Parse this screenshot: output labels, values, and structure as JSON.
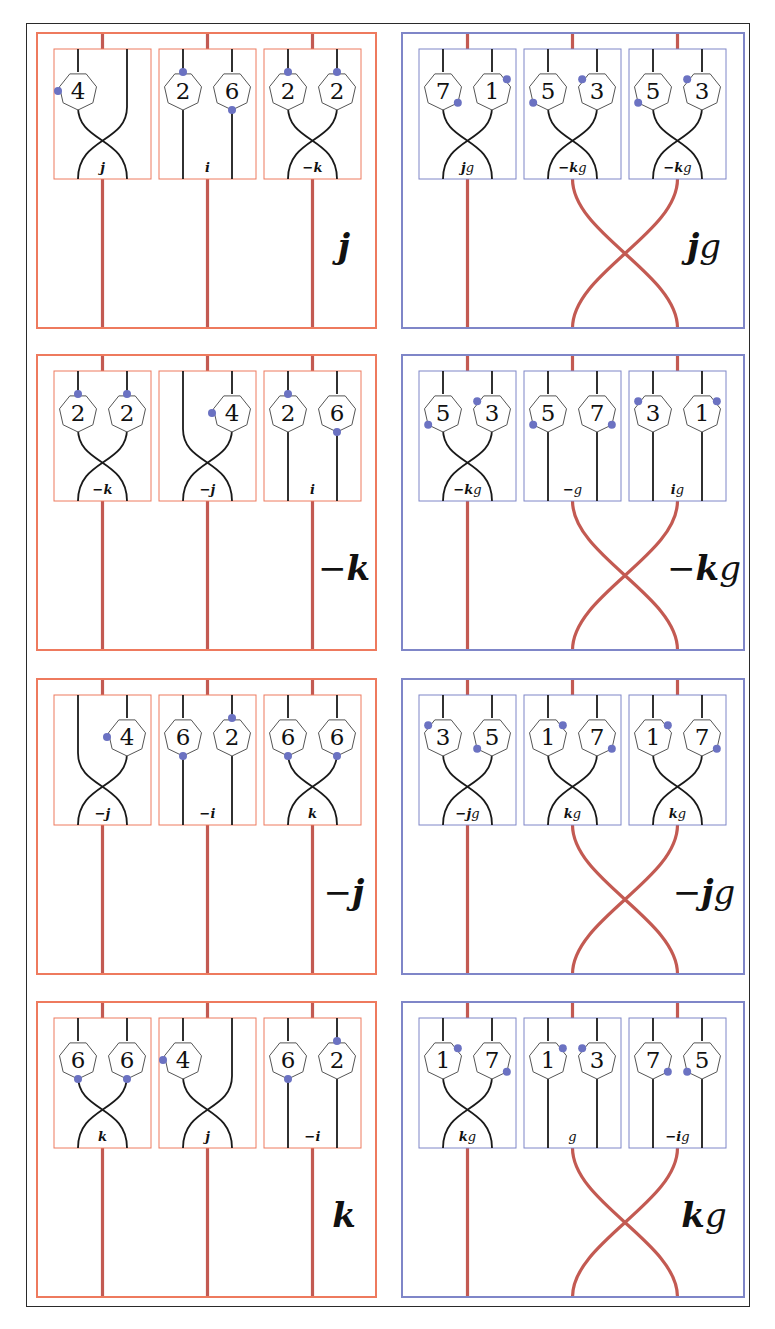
{
  "figure": {
    "colors": {
      "frame": "#2a2a2a",
      "orange_border": "#ee7a5e",
      "blue_border": "#7f86c8",
      "red_strand": "#c35a52",
      "black_strand": "#1a1a1a",
      "dot": "#6b72c2",
      "heptagon_stroke": "#555555"
    },
    "rows": [
      {
        "left": {
          "color": "orange",
          "label": "j",
          "label_suffix": "",
          "label_sign": "",
          "bottom_twist": false,
          "boxes": [
            {
              "sign_label": "j",
              "suffix": "",
              "strands": "cross",
              "gons": [
                {
                  "pos": "L",
                  "n": "4",
                  "dot": "left"
                }
              ]
            },
            {
              "sign_label": "i",
              "suffix": "",
              "strands": "straight",
              "gons": [
                {
                  "pos": "L",
                  "n": "2",
                  "dot": "top"
                },
                {
                  "pos": "R",
                  "n": "6",
                  "dot": "bottom"
                }
              ]
            },
            {
              "sign_label": "−k",
              "suffix": "",
              "strands": "cross",
              "gons": [
                {
                  "pos": "L",
                  "n": "2",
                  "dot": "top"
                },
                {
                  "pos": "R",
                  "n": "2",
                  "dot": "top"
                }
              ]
            }
          ]
        },
        "right": {
          "color": "blue",
          "label": "j",
          "label_suffix": "g",
          "label_sign": "",
          "bottom_twist": true,
          "boxes": [
            {
              "sign_label": "j",
              "suffix": "g",
              "strands": "cross",
              "gons": [
                {
                  "pos": "L",
                  "n": "7",
                  "dot": "bottom-right"
                },
                {
                  "pos": "R",
                  "n": "1",
                  "dot": "top-right"
                }
              ]
            },
            {
              "sign_label": "−k",
              "suffix": "g",
              "strands": "cross",
              "gons": [
                {
                  "pos": "L",
                  "n": "5",
                  "dot": "bottom-left"
                },
                {
                  "pos": "R",
                  "n": "3",
                  "dot": "top-left"
                }
              ]
            },
            {
              "sign_label": "−k",
              "suffix": "g",
              "strands": "cross",
              "gons": [
                {
                  "pos": "L",
                  "n": "5",
                  "dot": "bottom-left"
                },
                {
                  "pos": "R",
                  "n": "3",
                  "dot": "top-left"
                }
              ]
            }
          ]
        }
      },
      {
        "left": {
          "color": "orange",
          "label": "k",
          "label_suffix": "",
          "label_sign": "−",
          "bottom_twist": false,
          "boxes": [
            {
              "sign_label": "−k",
              "suffix": "",
              "strands": "cross",
              "gons": [
                {
                  "pos": "L",
                  "n": "2",
                  "dot": "top"
                },
                {
                  "pos": "R",
                  "n": "2",
                  "dot": "top"
                }
              ]
            },
            {
              "sign_label": "−j",
              "suffix": "",
              "strands": "cross",
              "gons": [
                {
                  "pos": "R",
                  "n": "4",
                  "dot": "left"
                }
              ]
            },
            {
              "sign_label": "i",
              "suffix": "",
              "strands": "straight",
              "gons": [
                {
                  "pos": "L",
                  "n": "2",
                  "dot": "top"
                },
                {
                  "pos": "R",
                  "n": "6",
                  "dot": "bottom"
                }
              ]
            }
          ]
        },
        "right": {
          "color": "blue",
          "label": "k",
          "label_suffix": "g",
          "label_sign": "−",
          "bottom_twist": true,
          "boxes": [
            {
              "sign_label": "−k",
              "suffix": "g",
              "strands": "cross",
              "gons": [
                {
                  "pos": "L",
                  "n": "5",
                  "dot": "bottom-left"
                },
                {
                  "pos": "R",
                  "n": "3",
                  "dot": "top-left"
                }
              ]
            },
            {
              "sign_label": "−",
              "suffix": "g",
              "strands": "straight",
              "gons": [
                {
                  "pos": "L",
                  "n": "5",
                  "dot": "bottom-left"
                },
                {
                  "pos": "R",
                  "n": "7",
                  "dot": "bottom-right"
                }
              ]
            },
            {
              "sign_label": "i",
              "suffix": "g",
              "strands": "straight",
              "gons": [
                {
                  "pos": "L",
                  "n": "3",
                  "dot": "top-left"
                },
                {
                  "pos": "R",
                  "n": "1",
                  "dot": "top-right"
                }
              ]
            }
          ]
        }
      },
      {
        "left": {
          "color": "orange",
          "label": "j",
          "label_suffix": "",
          "label_sign": "−",
          "bottom_twist": false,
          "boxes": [
            {
              "sign_label": "−j",
              "suffix": "",
              "strands": "cross",
              "gons": [
                {
                  "pos": "R",
                  "n": "4",
                  "dot": "left"
                }
              ]
            },
            {
              "sign_label": "−i",
              "suffix": "",
              "strands": "straight",
              "gons": [
                {
                  "pos": "L",
                  "n": "6",
                  "dot": "bottom"
                },
                {
                  "pos": "R",
                  "n": "2",
                  "dot": "top"
                }
              ]
            },
            {
              "sign_label": "k",
              "suffix": "",
              "strands": "cross",
              "gons": [
                {
                  "pos": "L",
                  "n": "6",
                  "dot": "bottom"
                },
                {
                  "pos": "R",
                  "n": "6",
                  "dot": "bottom"
                }
              ]
            }
          ]
        },
        "right": {
          "color": "blue",
          "label": "j",
          "label_suffix": "g",
          "label_sign": "−",
          "bottom_twist": true,
          "boxes": [
            {
              "sign_label": "−j",
              "suffix": "g",
              "strands": "cross",
              "gons": [
                {
                  "pos": "L",
                  "n": "3",
                  "dot": "top-left"
                },
                {
                  "pos": "R",
                  "n": "5",
                  "dot": "bottom-left"
                }
              ]
            },
            {
              "sign_label": "k",
              "suffix": "g",
              "strands": "cross",
              "gons": [
                {
                  "pos": "L",
                  "n": "1",
                  "dot": "top-right"
                },
                {
                  "pos": "R",
                  "n": "7",
                  "dot": "bottom-right"
                }
              ]
            },
            {
              "sign_label": "k",
              "suffix": "g",
              "strands": "cross",
              "gons": [
                {
                  "pos": "L",
                  "n": "1",
                  "dot": "top-right"
                },
                {
                  "pos": "R",
                  "n": "7",
                  "dot": "bottom-right"
                }
              ]
            }
          ]
        }
      },
      {
        "left": {
          "color": "orange",
          "label": "k",
          "label_suffix": "",
          "label_sign": "",
          "bottom_twist": false,
          "boxes": [
            {
              "sign_label": "k",
              "suffix": "",
              "strands": "cross",
              "gons": [
                {
                  "pos": "L",
                  "n": "6",
                  "dot": "bottom"
                },
                {
                  "pos": "R",
                  "n": "6",
                  "dot": "bottom"
                }
              ]
            },
            {
              "sign_label": "j",
              "suffix": "",
              "strands": "cross",
              "gons": [
                {
                  "pos": "L",
                  "n": "4",
                  "dot": "left"
                }
              ]
            },
            {
              "sign_label": "−i",
              "suffix": "",
              "strands": "straight",
              "gons": [
                {
                  "pos": "L",
                  "n": "6",
                  "dot": "bottom"
                },
                {
                  "pos": "R",
                  "n": "2",
                  "dot": "top"
                }
              ]
            }
          ]
        },
        "right": {
          "color": "blue",
          "label": "k",
          "label_suffix": "g",
          "label_sign": "",
          "bottom_twist": true,
          "boxes": [
            {
              "sign_label": "k",
              "suffix": "g",
              "strands": "cross",
              "gons": [
                {
                  "pos": "L",
                  "n": "1",
                  "dot": "top-right"
                },
                {
                  "pos": "R",
                  "n": "7",
                  "dot": "bottom-right"
                }
              ]
            },
            {
              "sign_label": "",
              "suffix": "g",
              "strands": "straight",
              "gons": [
                {
                  "pos": "L",
                  "n": "1",
                  "dot": "top-right"
                },
                {
                  "pos": "R",
                  "n": "3",
                  "dot": "top-left"
                }
              ]
            },
            {
              "sign_label": "−i",
              "suffix": "g",
              "strands": "straight",
              "gons": [
                {
                  "pos": "L",
                  "n": "7",
                  "dot": "bottom-right"
                },
                {
                  "pos": "R",
                  "n": "5",
                  "dot": "bottom-left"
                }
              ]
            }
          ]
        }
      }
    ]
  }
}
